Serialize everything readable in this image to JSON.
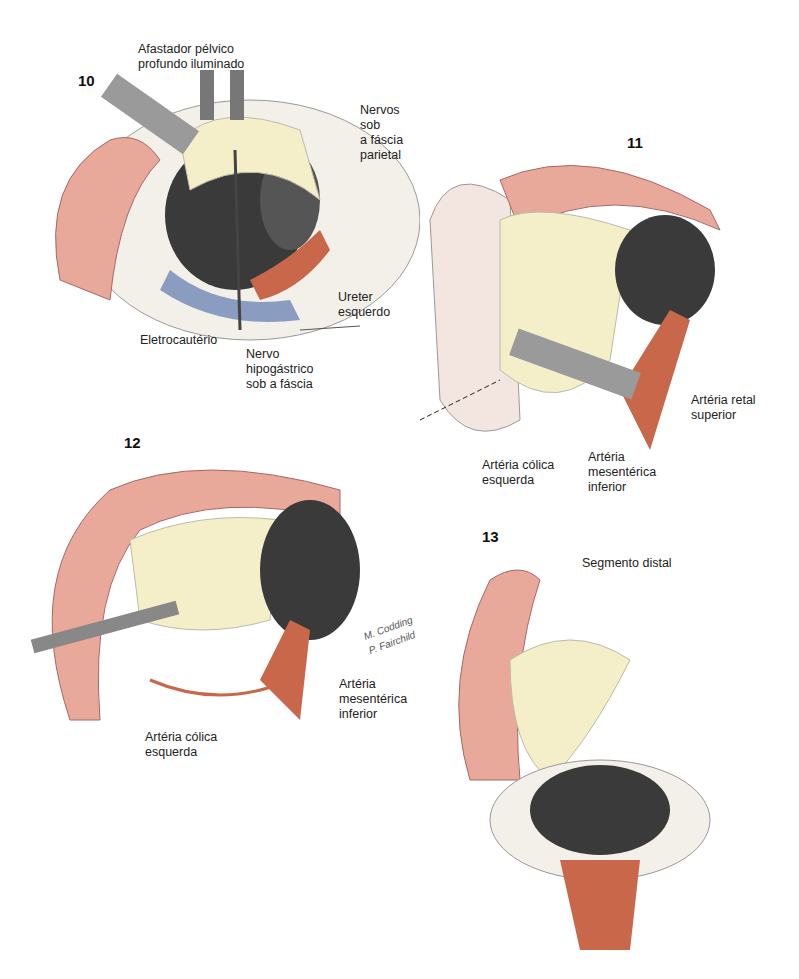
{
  "figure": {
    "panels": [
      {
        "number": "10",
        "labels": {
          "retractor": "Afastador pélvico\nprofundo iluminado",
          "nerves": "Nervos sob\na fáscia\nparietal",
          "ureter": "Ureter\nesquerdo",
          "cautery": "Eletrocautério",
          "hypogastric": "Nervo\nhipogástrico\nsob a fáscia"
        }
      },
      {
        "number": "11",
        "labels": {
          "rectal_artery": "Artéria retal\nsuperior",
          "colic_artery": "Artéria cólica\nesquerda",
          "mesenteric_artery": "Artéria\nmesentérica\ninferior"
        }
      },
      {
        "number": "12",
        "labels": {
          "mesenteric_artery": "Artéria\nmesentérica\ninferior",
          "colic_artery": "Artéria cólica\nesquerda"
        },
        "signature": "M. Codding\nP. Fairchild"
      },
      {
        "number": "13",
        "labels": {
          "distal_segment": "Segmento distal"
        }
      }
    ],
    "colors": {
      "colon": "#e9a99a",
      "mesentery": "#f4efc8",
      "artery": "#c8674a",
      "vein": "#8a9cc0",
      "pelvis": "#3a3a3a",
      "instrument": "#9a9a9a"
    }
  }
}
